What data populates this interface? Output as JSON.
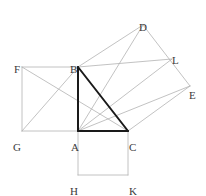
{
  "figure": {
    "canvas": {
      "width": 206,
      "height": 196
    },
    "style": {
      "background": "#ffffff",
      "thin_stroke": "#b3b3b3",
      "thin_stroke_dark": "#9a9a9a",
      "bold_stroke": "#1a1a1a",
      "label_color": "#3a3a3a",
      "thin_width": 0.8,
      "bold_width": 2.0
    },
    "points": {
      "A": {
        "x": 78,
        "y": 131,
        "label": "A",
        "label_x": 71,
        "label_y": 142
      },
      "B": {
        "x": 78,
        "y": 67,
        "label": "B",
        "label_x": 70,
        "label_y": 64
      },
      "C": {
        "x": 128,
        "y": 131,
        "label": "C",
        "label_x": 129,
        "label_y": 142
      },
      "D": {
        "x": 143,
        "y": 25,
        "label": "D",
        "label_x": 139,
        "label_y": 22
      },
      "E": {
        "x": 190,
        "y": 86,
        "label": "E",
        "label_x": 189,
        "label_y": 90
      },
      "F": {
        "x": 22,
        "y": 67,
        "label": "F",
        "label_x": 14,
        "label_y": 64
      },
      "G": {
        "x": 22,
        "y": 131,
        "label": "G",
        "label_x": 13,
        "label_y": 142
      },
      "H": {
        "x": 78,
        "y": 175,
        "label": "H",
        "label_x": 70,
        "label_y": 186
      },
      "K": {
        "x": 128,
        "y": 175,
        "label": "K",
        "label_x": 129,
        "label_y": 186
      },
      "L": {
        "x": 172,
        "y": 59,
        "label": "L",
        "label_x": 172,
        "label_y": 55
      }
    },
    "thin_segments": [
      {
        "name": "square-left-top",
        "from": "F",
        "to": "B"
      },
      {
        "name": "square-left-side",
        "from": "F",
        "to": "G"
      },
      {
        "name": "square-left-bottom",
        "from": "G",
        "to": "A"
      },
      {
        "name": "square-bottom-left",
        "from": "A",
        "to": "H"
      },
      {
        "name": "square-bottom-base",
        "from": "H",
        "to": "K"
      },
      {
        "name": "square-bottom-right",
        "from": "K",
        "to": "C"
      },
      {
        "name": "hyp-square-bd",
        "from": "B",
        "to": "D"
      },
      {
        "name": "hyp-square-de",
        "from": "D",
        "to": "E"
      },
      {
        "name": "hyp-square-ec",
        "from": "E",
        "to": "C"
      },
      {
        "name": "cevian-f-to-c",
        "from": "F",
        "to": "C"
      },
      {
        "name": "cevian-g-to-b",
        "from": "G",
        "to": "B"
      },
      {
        "name": "cevian-a-to-d",
        "from": "A",
        "to": "D"
      },
      {
        "name": "cevian-a-to-l",
        "from": "A",
        "to": "L"
      },
      {
        "name": "cevian-a-to-e",
        "from": "A",
        "to": "E"
      },
      {
        "name": "cevian-b-to-l",
        "from": "B",
        "to": "L"
      }
    ],
    "bold_segments": [
      {
        "name": "triangle-leg-ab",
        "from": "A",
        "to": "B"
      },
      {
        "name": "triangle-leg-ac",
        "from": "A",
        "to": "C"
      },
      {
        "name": "triangle-hyp-bc",
        "from": "B",
        "to": "C"
      }
    ],
    "labels_order": [
      "D",
      "L",
      "F",
      "B",
      "E",
      "G",
      "A",
      "C",
      "H",
      "K"
    ]
  }
}
